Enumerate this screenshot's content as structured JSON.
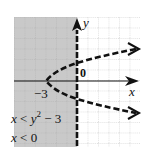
{
  "graph": {
    "title": "Graph of system x < y^2 - 3, x < 0",
    "axis_labels": {
      "x": "x",
      "y": "y"
    },
    "origin_label": "0",
    "tick_labels": [
      {
        "value": "-3",
        "text": "−3"
      }
    ],
    "inequalities": [
      {
        "lhs": "x",
        "op": "<",
        "rhs_base": "y",
        "rhs_exp": "2",
        "rhs_tail": " − 3"
      },
      {
        "lhs": "x",
        "op": "<",
        "rhs": "0"
      }
    ],
    "boundaries": [
      {
        "equation": "x = y^2 - 3",
        "style": "dashed",
        "vertex": [
          -3,
          0
        ]
      },
      {
        "equation": "x = 0",
        "style": "dashed"
      }
    ],
    "shaded_region": "x < 0 and x < y^2 - 3",
    "colors": {
      "shade": "#c9c9c9",
      "grid": "#9a9a9a",
      "curve": "#111111",
      "background": "#ffffff"
    },
    "grid": {
      "x_range": [
        -6,
        6
      ],
      "y_range": [
        -6,
        6
      ],
      "unit_px": 10.5
    }
  }
}
